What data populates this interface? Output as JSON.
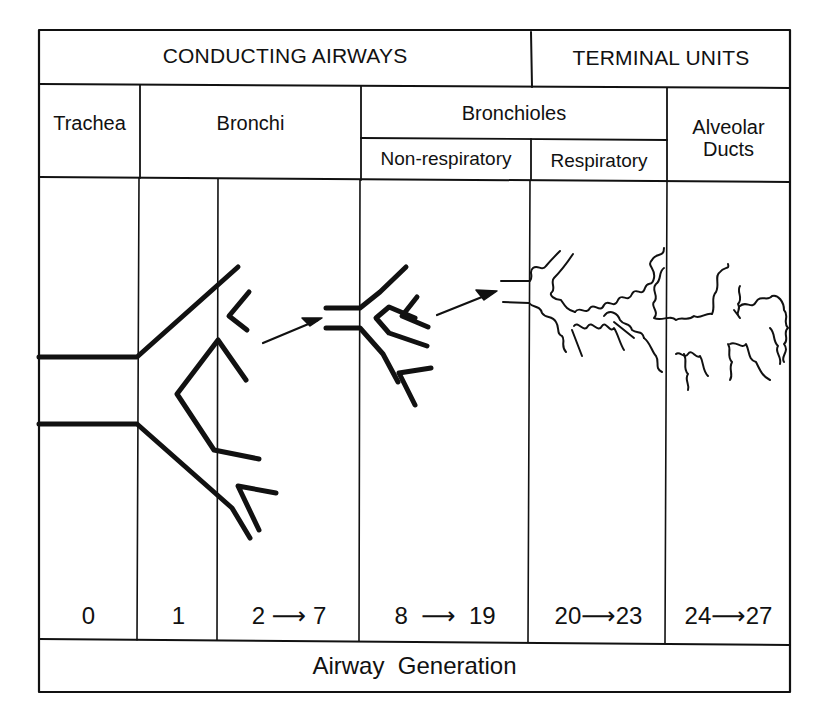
{
  "figure": {
    "header": {
      "conducting": "CONDUCTING AIRWAYS",
      "terminal": "TERMINAL UNITS"
    },
    "regions": {
      "trachea": "Trachea",
      "bronchi": "Bronchi",
      "bronchioles": "Bronchioles",
      "non_respiratory": "Non-respiratory",
      "respiratory": "Respiratory",
      "alveolar_line1": "Alveolar",
      "alveolar_line2": "Ducts"
    },
    "generations": [
      {
        "from": "0",
        "arrow": "",
        "to": ""
      },
      {
        "from": "1",
        "arrow": "",
        "to": ""
      },
      {
        "from": "2",
        "arrow": "⟶",
        "to": "7"
      },
      {
        "from": "8",
        "arrow": "⟶",
        "to": "19"
      },
      {
        "from": "20",
        "arrow": "⟶",
        "to": "23"
      },
      {
        "from": "24",
        "arrow": "⟶",
        "to": "27"
      }
    ],
    "footer": "Airway  Generation",
    "colors": {
      "line": "#111111",
      "background": "#ffffff"
    }
  }
}
